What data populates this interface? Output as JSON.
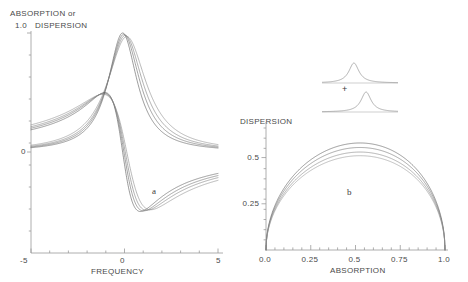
{
  "figure": {
    "panel_a": {
      "ylabel_line1": "ABSORPTION or",
      "ylabel_line2": "DISPERSION",
      "xlabel": "FREQUENCY",
      "letter": "a",
      "ytick_top": "1.0",
      "ytick_zero": "0",
      "xtick_left": "-5",
      "xtick_mid": "0",
      "xtick_right": "5"
    },
    "panel_b": {
      "ylabel": "DISPERSION",
      "xlabel": "ABSORPTION",
      "letter": "b",
      "yticks": [
        "0.25",
        "0.5"
      ],
      "xticks": [
        "0.0",
        "0.25",
        "0.5",
        "0.75",
        "1.0"
      ]
    },
    "inset": {
      "plus_sign": "+"
    }
  },
  "chart_data": [
    {
      "type": "line",
      "id": "panel-a",
      "title": "",
      "xlabel": "FREQUENCY",
      "ylabel": "ABSORPTION or DISPERSION",
      "xlim": [
        -5,
        5
      ],
      "ylim": [
        -0.62,
        1.05
      ],
      "xticks": [
        -5,
        0,
        5
      ],
      "xticklabels": [
        "-5",
        "0",
        "5"
      ],
      "yticks": [
        0,
        1.0
      ],
      "yticklabels": [
        "0",
        "1.0"
      ],
      "grid": false,
      "legend": false,
      "annotations": [
        {
          "text": "a",
          "x": 2.1,
          "y": -0.27
        }
      ],
      "note": "Lorentzian absorption lineshapes (peak ~1.0 at f=0) overlaid with their dispersion counterparts (antisymmetric, crossing zero near f=0.35, min ~-0.52, max ~+0.5). Four mixing ratios per family.",
      "series": [
        {
          "name": "absorption-1",
          "color": "#555555",
          "gamma": 0.95,
          "shift": -0.1,
          "kind": "absorption",
          "amp": 1.0
        },
        {
          "name": "absorption-2",
          "color": "#666666",
          "gamma": 1.05,
          "shift": -0.03,
          "kind": "absorption",
          "amp": 0.99
        },
        {
          "name": "absorption-3",
          "color": "#777777",
          "gamma": 1.15,
          "shift": 0.04,
          "kind": "absorption",
          "amp": 0.98
        },
        {
          "name": "absorption-4",
          "color": "#888888",
          "gamma": 1.28,
          "shift": 0.12,
          "kind": "absorption",
          "amp": 0.97
        },
        {
          "name": "dispersion-1",
          "color": "#555555",
          "gamma": 0.95,
          "shift": -0.1,
          "kind": "dispersion",
          "amp": 1.0
        },
        {
          "name": "dispersion-2",
          "color": "#666666",
          "gamma": 1.05,
          "shift": -0.03,
          "kind": "dispersion",
          "amp": 0.99
        },
        {
          "name": "dispersion-3",
          "color": "#777777",
          "gamma": 1.15,
          "shift": 0.04,
          "kind": "dispersion",
          "amp": 0.98
        },
        {
          "name": "dispersion-4",
          "color": "#888888",
          "gamma": 1.28,
          "shift": 0.12,
          "kind": "dispersion",
          "amp": 0.97
        }
      ]
    },
    {
      "type": "line",
      "id": "panel-b",
      "title": "",
      "xlabel": "ABSORPTION",
      "ylabel": "DISPERSION",
      "xlim": [
        0,
        1.0
      ],
      "ylim": [
        0,
        0.66
      ],
      "xticks": [
        0.0,
        0.25,
        0.5,
        0.75,
        1.0
      ],
      "xticklabels": [
        "0.0",
        "0.25",
        "0.5",
        "0.75",
        "1.0"
      ],
      "yticks": [
        0.25,
        0.5
      ],
      "yticklabels": [
        "0.25",
        "0.5"
      ],
      "grid": false,
      "legend": false,
      "annotations": [
        {
          "text": "b",
          "x": 0.56,
          "y": 0.29
        }
      ],
      "note": "Four semicircle-like absorption-dispersion (Cole-Cole style) arcs with peak dispersion values 0.58, 0.555, 0.53, 0.51 at absorption ~0.52.",
      "series": [
        {
          "name": "arc-1",
          "color": "#555555",
          "peak": 0.58,
          "peak_x": 0.53,
          "exp": 0.5
        },
        {
          "name": "arc-2",
          "color": "#6b6b6b",
          "peak": 0.555,
          "peak_x": 0.52,
          "exp": 0.5
        },
        {
          "name": "arc-3",
          "color": "#808080",
          "peak": 0.53,
          "peak_x": 0.515,
          "exp": 0.5
        },
        {
          "name": "arc-4",
          "color": "#949494",
          "peak": 0.51,
          "peak_x": 0.51,
          "exp": 0.5
        }
      ]
    },
    {
      "type": "line",
      "id": "inset",
      "title": "",
      "xlabel": "",
      "ylabel": "",
      "grid": false,
      "legend": false,
      "note": "Two small Lorentzian peaks stacked vertically with a plus sign between them, indicating the sum of two lineshapes.",
      "series": [
        {
          "name": "inset-peak-upper",
          "color": "#8f8f8f",
          "center": 0.42,
          "width": 0.16
        },
        {
          "name": "inset-peak-lower",
          "color": "#8f8f8f",
          "center": 0.58,
          "width": 0.16
        }
      ]
    }
  ]
}
